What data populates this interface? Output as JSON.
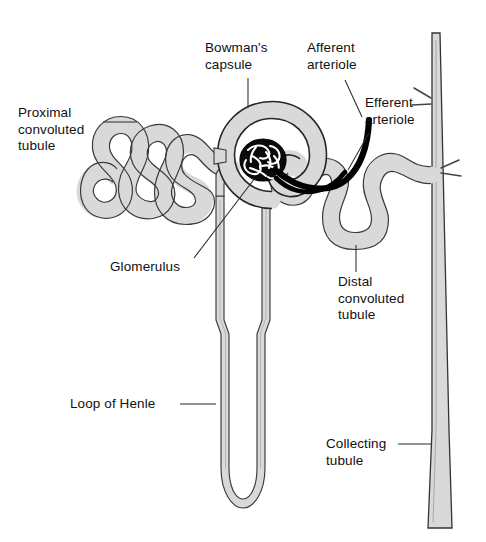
{
  "figure": {
    "background_color": "#ffffff",
    "tubule_fill_color": "#d9d9d9",
    "outline_color": "#1a1a1a",
    "vessel_color": "#000000",
    "label_color": "#111111"
  },
  "labels": {
    "proximal_convoluted_tubule": "Proximal\nconvoluted\ntubule",
    "bowmans_capsule": "Bowman's\ncapsule",
    "afferent_arteriole": "Afferent\narteriole",
    "efferent_arteriole": "Efferent\narteriole",
    "glomerulus": "Glomerulus",
    "distal_convoluted_tubule": "Distal\nconvoluted\ntubule",
    "loop_of_henle": "Loop of Henle",
    "collecting_tubule": "Collecting\ntubule"
  },
  "structures": [
    {
      "name": "proximal-convoluted-tubule",
      "kind": "tubule",
      "fill": "#d9d9d9"
    },
    {
      "name": "bowmans-capsule",
      "kind": "capsule",
      "fill": "#d9d9d9"
    },
    {
      "name": "glomerulus",
      "kind": "capillary-tuft",
      "fill": "#000000"
    },
    {
      "name": "afferent-arteriole",
      "kind": "vessel",
      "fill": "#000000"
    },
    {
      "name": "efferent-arteriole",
      "kind": "vessel",
      "fill": "#000000"
    },
    {
      "name": "distal-convoluted-tubule",
      "kind": "tubule",
      "fill": "#d9d9d9"
    },
    {
      "name": "loop-of-henle",
      "kind": "tubule-loop",
      "fill": "#d9d9d9"
    },
    {
      "name": "collecting-tubule",
      "kind": "duct",
      "fill": "#d9d9d9"
    }
  ]
}
